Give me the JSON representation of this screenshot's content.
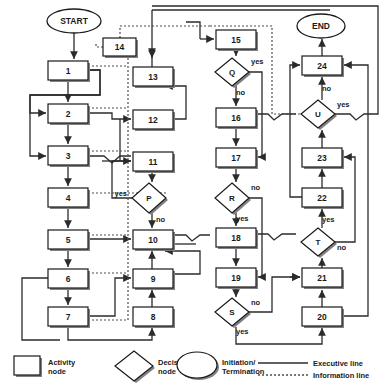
{
  "diagram": {
    "colors": {
      "node_fill": "#ffffff",
      "node_stroke": "#1a1a1a",
      "shadow": "#808080",
      "executive_line": "#2b2b2b",
      "information_line": "#4d4d4d",
      "text": "#1a1a1a"
    },
    "terminators": [
      {
        "id": "start",
        "label": "START",
        "cx": 74,
        "cy": 21,
        "rx": 27,
        "ry": 12
      },
      {
        "id": "end",
        "label": "END",
        "cx": 321,
        "cy": 26,
        "rx": 24,
        "ry": 12
      }
    ],
    "activity_nodes": [
      {
        "id": "n1",
        "label": "1",
        "x": 48,
        "y": 61,
        "w": 40,
        "h": 19
      },
      {
        "id": "n2",
        "label": "2",
        "x": 48,
        "y": 104,
        "w": 40,
        "h": 19
      },
      {
        "id": "n3",
        "label": "3",
        "x": 48,
        "y": 146,
        "w": 40,
        "h": 19
      },
      {
        "id": "n4",
        "label": "4",
        "x": 48,
        "y": 188,
        "w": 40,
        "h": 19
      },
      {
        "id": "n5",
        "label": "5",
        "x": 48,
        "y": 230,
        "w": 40,
        "h": 19
      },
      {
        "id": "n6",
        "label": "6",
        "x": 48,
        "y": 269,
        "w": 40,
        "h": 19
      },
      {
        "id": "n7",
        "label": "7",
        "x": 48,
        "y": 307,
        "w": 40,
        "h": 19
      },
      {
        "id": "n8",
        "label": "8",
        "x": 133,
        "y": 307,
        "w": 40,
        "h": 19
      },
      {
        "id": "n9",
        "label": "9",
        "x": 133,
        "y": 269,
        "w": 40,
        "h": 19
      },
      {
        "id": "n10",
        "label": "10",
        "x": 133,
        "y": 230,
        "w": 40,
        "h": 19
      },
      {
        "id": "n11",
        "label": "11",
        "x": 133,
        "y": 152,
        "w": 40,
        "h": 19
      },
      {
        "id": "n12",
        "label": "12",
        "x": 133,
        "y": 110,
        "w": 40,
        "h": 19
      },
      {
        "id": "n13",
        "label": "13",
        "x": 133,
        "y": 67,
        "w": 40,
        "h": 19
      },
      {
        "id": "n14",
        "label": "14",
        "x": 103,
        "y": 38,
        "w": 33,
        "h": 18
      },
      {
        "id": "n15",
        "label": "15",
        "x": 216,
        "y": 30,
        "w": 40,
        "h": 19
      },
      {
        "id": "n16",
        "label": "16",
        "x": 216,
        "y": 108,
        "w": 40,
        "h": 19
      },
      {
        "id": "n17",
        "label": "17",
        "x": 216,
        "y": 148,
        "w": 40,
        "h": 19
      },
      {
        "id": "n18",
        "label": "18",
        "x": 216,
        "y": 228,
        "w": 40,
        "h": 19
      },
      {
        "id": "n19",
        "label": "19",
        "x": 216,
        "y": 268,
        "w": 40,
        "h": 19
      },
      {
        "id": "n20",
        "label": "20",
        "x": 302,
        "y": 307,
        "w": 40,
        "h": 19
      },
      {
        "id": "n21",
        "label": "21",
        "x": 302,
        "y": 268,
        "w": 40,
        "h": 19
      },
      {
        "id": "n22",
        "label": "22",
        "x": 302,
        "y": 188,
        "w": 40,
        "h": 19
      },
      {
        "id": "n23",
        "label": "23",
        "x": 302,
        "y": 148,
        "w": 40,
        "h": 19
      },
      {
        "id": "n24",
        "label": "24",
        "x": 302,
        "y": 56,
        "w": 40,
        "h": 19
      }
    ],
    "decision_nodes": [
      {
        "id": "dP",
        "label": "P",
        "cx": 149,
        "cy": 198,
        "rx": 17,
        "ry": 15
      },
      {
        "id": "dQ",
        "label": "Q",
        "cx": 232,
        "cy": 72,
        "rx": 17,
        "ry": 14
      },
      {
        "id": "dR",
        "label": "R",
        "cx": 232,
        "cy": 198,
        "rx": 17,
        "ry": 15
      },
      {
        "id": "dS",
        "label": "S",
        "cx": 232,
        "cy": 312,
        "rx": 17,
        "ry": 14
      },
      {
        "id": "dT",
        "label": "T",
        "cx": 318,
        "cy": 242,
        "rx": 17,
        "ry": 14
      },
      {
        "id": "dU",
        "label": "U",
        "cx": 318,
        "cy": 114,
        "rx": 17,
        "ry": 14
      }
    ],
    "branch_labels": [
      {
        "id": "p-yes",
        "text": "yes",
        "x": 127,
        "y": 196,
        "anchor": "end"
      },
      {
        "id": "p-no",
        "text": "no",
        "x": 156,
        "y": 222,
        "anchor": "start"
      },
      {
        "id": "q-yes",
        "text": "yes",
        "x": 251,
        "y": 64,
        "anchor": "start"
      },
      {
        "id": "q-no",
        "text": "no",
        "x": 236,
        "y": 95,
        "anchor": "start"
      },
      {
        "id": "r-no",
        "text": "no",
        "x": 251,
        "y": 190,
        "anchor": "start"
      },
      {
        "id": "r-yes",
        "text": "yes",
        "x": 236,
        "y": 221,
        "anchor": "start"
      },
      {
        "id": "s-no",
        "text": "no",
        "x": 251,
        "y": 305,
        "anchor": "start"
      },
      {
        "id": "s-yes",
        "text": "yes",
        "x": 236,
        "y": 334,
        "anchor": "start"
      },
      {
        "id": "t-yes",
        "text": "yes",
        "x": 322,
        "y": 222,
        "anchor": "start"
      },
      {
        "id": "t-no",
        "text": "no",
        "x": 337,
        "y": 250,
        "anchor": "start"
      },
      {
        "id": "u-yes",
        "text": "yes",
        "x": 337,
        "y": 107,
        "anchor": "start"
      },
      {
        "id": "u-no",
        "text": "no",
        "x": 322,
        "y": 91,
        "anchor": "start"
      }
    ],
    "legend": {
      "items": [
        {
          "id": "legend-activity",
          "shape": "rect",
          "line1": "Activity",
          "line2": "node"
        },
        {
          "id": "legend-decision",
          "shape": "diamond",
          "line1": "Decision",
          "line2": "node"
        },
        {
          "id": "legend-terminal",
          "shape": "ellipse",
          "line1": "Initiation/",
          "line2": "Termination"
        },
        {
          "id": "legend-executive",
          "shape": "solid",
          "line1": "Executive line",
          "line2": ""
        },
        {
          "id": "legend-information",
          "shape": "dotted",
          "line1": "Information line",
          "line2": ""
        }
      ]
    }
  }
}
